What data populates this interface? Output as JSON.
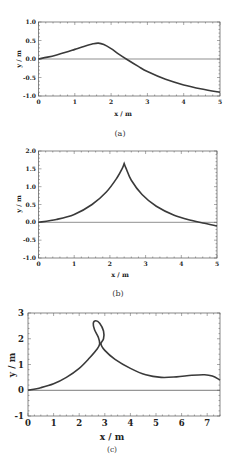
{
  "chart_data": [
    {
      "type": "line",
      "panel_label": "(a)",
      "xlabel": "x / m",
      "ylabel": "y / m",
      "xlim": [
        0,
        5
      ],
      "ylim": [
        -1.0,
        1.0
      ],
      "xticks": [
        "0",
        "1",
        "2",
        "3",
        "4",
        "5"
      ],
      "yticks": [
        "1.0",
        "0.5",
        "0.0",
        "-0.5",
        "-1.0"
      ],
      "grid": false,
      "reference_line": {
        "y": 0
      },
      "series": [
        {
          "name": "trajectory",
          "x": [
            0,
            0.25,
            0.5,
            0.75,
            1.0,
            1.25,
            1.5,
            1.65,
            1.8,
            2.0,
            2.2,
            2.45,
            2.75,
            3.0,
            3.5,
            4.0,
            4.5,
            5.0
          ],
          "y": [
            0.0,
            0.05,
            0.11,
            0.18,
            0.26,
            0.34,
            0.41,
            0.43,
            0.39,
            0.28,
            0.14,
            -0.02,
            -0.2,
            -0.34,
            -0.55,
            -0.7,
            -0.81,
            -0.9
          ]
        }
      ]
    },
    {
      "type": "line",
      "panel_label": "(b)",
      "xlabel": "x / m",
      "ylabel": "y / m",
      "xlim": [
        0,
        5
      ],
      "ylim": [
        -1.0,
        2.0
      ],
      "xticks": [
        "0",
        "1",
        "2",
        "3",
        "4",
        "5"
      ],
      "yticks": [
        "2.0",
        "1.5",
        "1.0",
        "0.5",
        "0.0",
        "-0.5",
        "-1.0"
      ],
      "grid": false,
      "reference_line": {
        "y": 0
      },
      "series": [
        {
          "name": "trajectory",
          "x": [
            0,
            0.5,
            1.0,
            1.5,
            1.9,
            2.2,
            2.35,
            2.4,
            2.45,
            2.6,
            2.9,
            3.3,
            3.8,
            4.3,
            4.6,
            5.0
          ],
          "y": [
            0.0,
            0.08,
            0.22,
            0.5,
            0.85,
            1.25,
            1.52,
            1.65,
            1.52,
            1.18,
            0.78,
            0.45,
            0.2,
            0.05,
            -0.02,
            -0.1
          ]
        }
      ]
    },
    {
      "type": "line",
      "panel_label": "(c)",
      "xlabel": "x / m",
      "ylabel": "y / m",
      "xlim": [
        0,
        7.5
      ],
      "ylim": [
        -1,
        3
      ],
      "xticks": [
        "0",
        "1",
        "2",
        "3",
        "4",
        "5",
        "6",
        "7"
      ],
      "yticks": [
        "3",
        "2",
        "1",
        "0",
        "-1"
      ],
      "grid": false,
      "reference_line": {
        "y": 0
      },
      "series": [
        {
          "name": "trajectory",
          "x": [
            0,
            0.5,
            1.0,
            1.5,
            2.0,
            2.4,
            2.7,
            2.8,
            2.75,
            2.6,
            2.55,
            2.65,
            2.8,
            2.95,
            2.95,
            2.85,
            3.0,
            3.4,
            4.0,
            4.6,
            5.2,
            5.8,
            6.4,
            6.9,
            7.2,
            7.5
          ],
          "y": [
            0.0,
            0.1,
            0.25,
            0.5,
            0.85,
            1.25,
            1.6,
            1.8,
            2.05,
            2.35,
            2.6,
            2.7,
            2.6,
            2.3,
            2.0,
            1.8,
            1.55,
            1.2,
            0.85,
            0.6,
            0.5,
            0.52,
            0.58,
            0.6,
            0.55,
            0.4
          ]
        }
      ]
    }
  ],
  "panels": {
    "a": {
      "caption": "(a)",
      "xlabel": "x / m",
      "ylabel": "y / m",
      "xticks": [
        "0",
        "1",
        "2",
        "3",
        "4",
        "5"
      ],
      "yticks": [
        "1.0",
        "0.5",
        "0.0",
        "-0.5",
        "-1.0"
      ]
    },
    "b": {
      "caption": "(b)",
      "xlabel": "x / m",
      "ylabel": "y / m",
      "xticks": [
        "0",
        "1",
        "2",
        "3",
        "4",
        "5"
      ],
      "yticks": [
        "2.0",
        "1.5",
        "1.0",
        "0.5",
        "0.0",
        "-0.5",
        "-1.0"
      ]
    },
    "c": {
      "caption": "(c)",
      "xlabel": "x / m",
      "ylabel": "y / m",
      "xticks": [
        "0",
        "1",
        "2",
        "3",
        "4",
        "5",
        "6",
        "7"
      ],
      "yticks": [
        "3",
        "2",
        "1",
        "0",
        "-1"
      ]
    }
  },
  "colors": {
    "curve": "#3a3a3a",
    "frame": "#555555",
    "zero_line": "#444444"
  }
}
